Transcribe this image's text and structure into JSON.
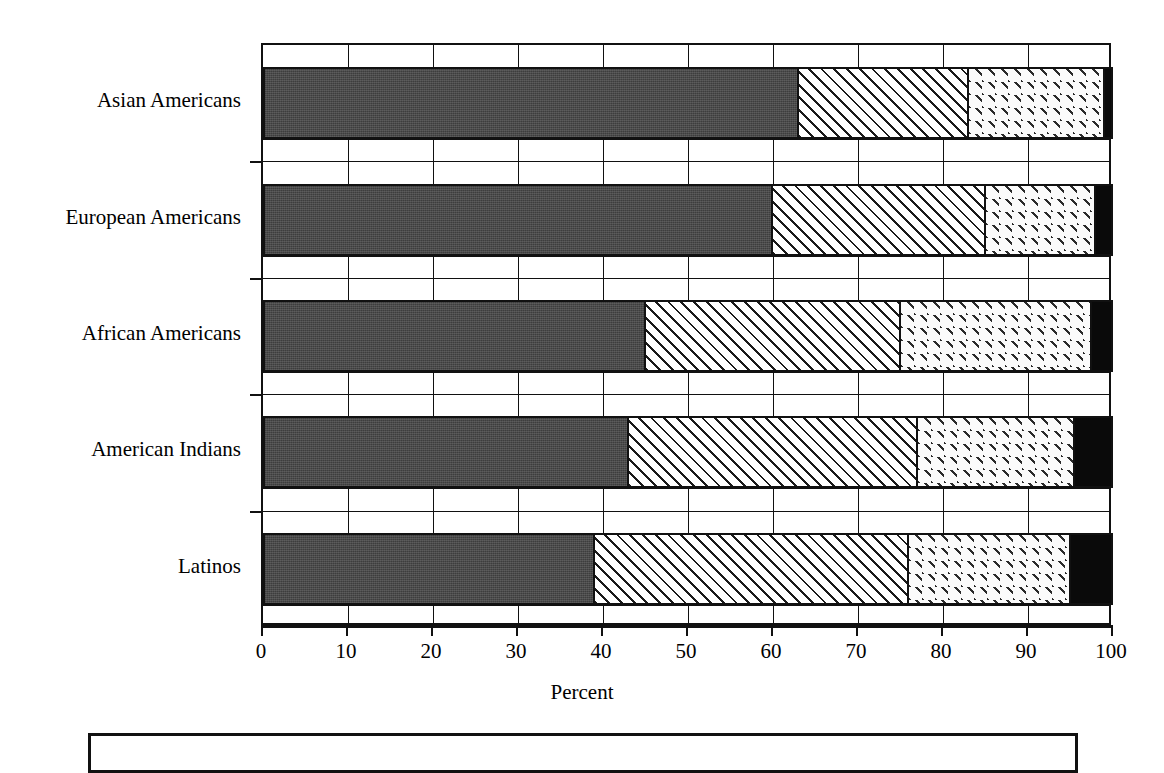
{
  "chart_data": {
    "type": "bar",
    "orientation": "horizontal",
    "stacked": true,
    "title": "",
    "xlabel": "Percent",
    "ylabel": "",
    "xlim": [
      0,
      100
    ],
    "xticks": [
      "0",
      "10",
      "20",
      "30",
      "40",
      "50",
      "60",
      "70",
      "80",
      "90",
      "100"
    ],
    "grid": true,
    "legend_position": "bottom",
    "categories": [
      "Asian Americans",
      "European Americans",
      "African Americans",
      "American Indians",
      "Latinos"
    ],
    "series": [
      {
        "name": "segment-1",
        "pattern": "solid-dark-gray",
        "color": "#4a4a4a",
        "values": [
          63,
          60,
          45,
          43,
          39
        ]
      },
      {
        "name": "segment-2",
        "pattern": "diagonal-hatch",
        "color": "#ffffff",
        "values": [
          20,
          25,
          30,
          34,
          37
        ]
      },
      {
        "name": "segment-3",
        "pattern": "fine-dotted",
        "color": "#fbfbfb",
        "values": [
          16,
          13,
          22.5,
          18.5,
          19
        ]
      },
      {
        "name": "segment-4",
        "pattern": "solid-black",
        "color": "#0a0a0a",
        "values": [
          1,
          2,
          2.5,
          4.5,
          5
        ]
      }
    ]
  },
  "axis": {
    "x_title": "Percent",
    "ticks": [
      "0",
      "10",
      "20",
      "30",
      "40",
      "50",
      "60",
      "70",
      "80",
      "90",
      "100"
    ],
    "category_labels": [
      "Asian Americans",
      "European Americans",
      "African Americans",
      "American Indians",
      "Latinos"
    ]
  },
  "legend": {
    "items": []
  }
}
